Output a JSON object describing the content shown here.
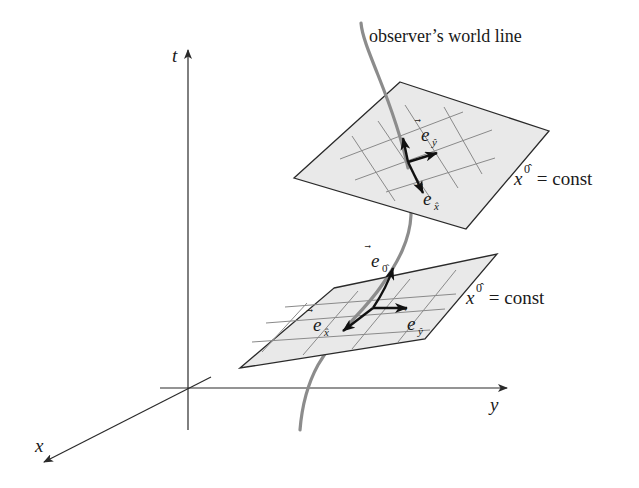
{
  "figure": {
    "type": "spacetime-diagram",
    "axes": {
      "t": {
        "label": "t"
      },
      "x": {
        "label": "x"
      },
      "y": {
        "label": "y"
      }
    },
    "world_line": {
      "label": "observer’s world line",
      "color": "#8c8c8c"
    },
    "planes": [
      {
        "id": "upper",
        "label_var": "x",
        "label_sup": "0̂",
        "label_rest": " = const",
        "vectors": [
          {
            "id": "e-y-upper",
            "base": "e",
            "sub": "ŷ"
          },
          {
            "id": "e-x-upper",
            "base": "e",
            "sub": "x̂"
          }
        ]
      },
      {
        "id": "lower",
        "label_var": "x",
        "label_sup": "0̂",
        "label_rest": " = const",
        "vectors": [
          {
            "id": "e-0-lower",
            "base": "e",
            "sub": "0̂"
          },
          {
            "id": "e-x-lower",
            "base": "e",
            "sub": "x̂"
          },
          {
            "id": "e-y-lower",
            "base": "e",
            "sub": "ŷ"
          }
        ]
      }
    ],
    "colors": {
      "plane_fill": "#e9e9e9",
      "outline": "#2a2a2a",
      "grid": "#8a8a8a",
      "vector": "#111111"
    }
  }
}
